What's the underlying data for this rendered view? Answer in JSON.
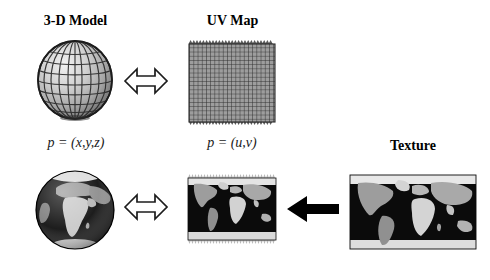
{
  "figure": {
    "title_top_left": "3-D Model",
    "title_top_middle": "UV Map",
    "title_right": "Texture",
    "caption_left": "p = (x,y,z)",
    "caption_middle": "p = (u,v)",
    "background_color": "#ffffff",
    "ink_color": "#000000"
  },
  "panels": {
    "wireframe_sphere": {
      "name": "wireframe-sphere",
      "description": "shaded grey sphere with latitude and longitude wireframe lines",
      "meridians": 12,
      "parallels": 7,
      "shading": "grey gradient, lit from upper-left"
    },
    "uv_grid": {
      "name": "uv-grid",
      "description": "square checkered UV parameter grid with frayed zigzag top and bottom edges",
      "columns": 22,
      "rows": 20,
      "fill_color": "#9a9a9a",
      "line_color": "#1a1a1a"
    },
    "textured_globe": {
      "name": "textured-globe",
      "description": "earth globe rendered with the world map texture, Africa and Europe facing viewer"
    },
    "mapped_texture": {
      "name": "mapped-texture",
      "description": "equirectangular world map applied to the UV square, ragged top and bottom edges"
    },
    "source_texture": {
      "name": "source-texture",
      "description": "source equirectangular world map image used as the texture"
    }
  },
  "arrows": {
    "top_double": {
      "name": "double-headed-arrow",
      "style": "outline",
      "direction": "bidirectional"
    },
    "bottom_double": {
      "name": "double-headed-arrow",
      "style": "outline",
      "direction": "bidirectional"
    },
    "texture_transfer": {
      "name": "left-arrow",
      "style": "solid",
      "direction": "left"
    }
  }
}
